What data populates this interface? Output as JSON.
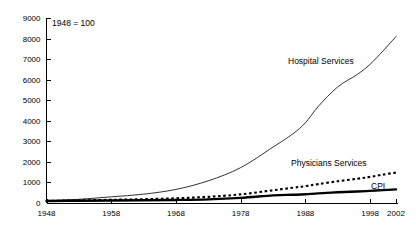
{
  "note": {
    "text": "1948 = 100"
  },
  "chart_data": {
    "type": "line",
    "title": "",
    "subtitle": "",
    "annotation": "1948 = 100",
    "xlabel": "",
    "ylabel": "",
    "xlim": [
      1948,
      2002
    ],
    "ylim": [
      0,
      9000
    ],
    "grid": false,
    "legend_position": "inline-labels",
    "x_ticks": [
      1948,
      1958,
      1968,
      1978,
      1988,
      1998,
      2002
    ],
    "x_tick_labels": [
      "1948",
      "1958",
      "1968",
      "1978",
      "1988",
      "1998",
      "2002"
    ],
    "y_ticks": [
      0,
      1000,
      2000,
      3000,
      4000,
      5000,
      6000,
      7000,
      8000,
      9000
    ],
    "y_tick_labels": [
      "0",
      "1000",
      "2000",
      "3000",
      "4000",
      "5000",
      "6000",
      "7000",
      "8000",
      "9000"
    ],
    "x": [
      1948,
      1953,
      1958,
      1963,
      1968,
      1973,
      1978,
      1983,
      1986,
      1988,
      1990,
      1993,
      1996,
      1998,
      2000,
      2002
    ],
    "series": [
      {
        "name": "Hospital Services",
        "style": "thin-solid",
        "label": "Hospital Services",
        "values": [
          100,
          180,
          300,
          430,
          660,
          1080,
          1720,
          2720,
          3350,
          3900,
          4700,
          5650,
          6250,
          6750,
          7400,
          8100
        ]
      },
      {
        "name": "Physicians Services",
        "style": "dotted",
        "label": "Physicians Services",
        "values": [
          100,
          125,
          155,
          185,
          230,
          300,
          420,
          620,
          740,
          820,
          920,
          1060,
          1180,
          1270,
          1380,
          1480
        ]
      },
      {
        "name": "CPI",
        "style": "thick-solid",
        "label": "CPI",
        "values": [
          100,
          113,
          122,
          132,
          147,
          178,
          250,
          370,
          400,
          425,
          470,
          520,
          560,
          590,
          625,
          665
        ]
      }
    ]
  },
  "labels": {
    "hospital_services": "Hospital Services",
    "physicians_services": "Physicians Services",
    "cpi": "CPI"
  }
}
